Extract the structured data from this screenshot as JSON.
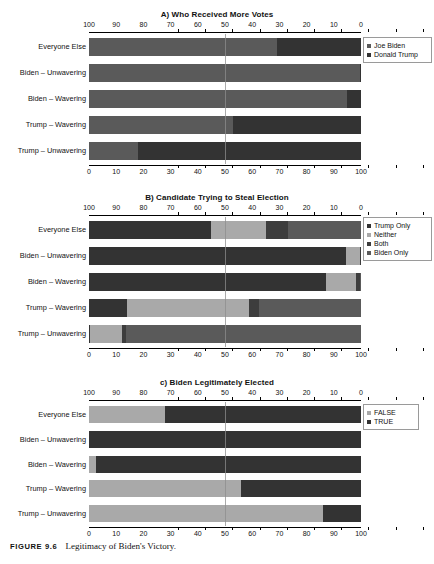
{
  "figure": {
    "caption_label": "FIGURE 9.6",
    "caption_text": "Legitimacy of Biden's Victory."
  },
  "categories": [
    "Everyone Else",
    "Biden – Unwavering",
    "Biden – Wavering",
    "Trump – Wavering",
    "Trump – Unwavering"
  ],
  "axis": {
    "top_ticks": [
      "100",
      "90",
      "80",
      "70",
      "60",
      "50",
      "40",
      "30",
      "20",
      "10",
      "0"
    ],
    "bottom_ticks": [
      "0",
      "10",
      "20",
      "30",
      "40",
      "50",
      "60",
      "70",
      "80",
      "90",
      "100"
    ],
    "min": 0,
    "max": 100,
    "reference_line": 50
  },
  "colors": {
    "dark": "#333333",
    "medium_dark": "#4e4e4e",
    "medium": "#5a5a5a",
    "light_gray": "#a9a9a9",
    "mid_gray": "#8e8e8e",
    "reference_line": "#8e8e8e",
    "text": "#111111"
  },
  "panels": [
    {
      "id": "panel-a",
      "title": "A) Who Received More Votes",
      "legend_labels": [
        "Joe Biden",
        "Donald Trump"
      ]
    },
    {
      "id": "panel-b",
      "title": "B) Candidate Trying to Steal Election",
      "legend_labels": [
        "Trump Only",
        "Neither",
        "Both",
        "Biden Only"
      ]
    },
    {
      "id": "panel-c",
      "title": "c) Biden Legitimately Elected",
      "legend_labels": [
        "FALSE",
        "TRUE"
      ]
    }
  ],
  "chart_data": [
    {
      "type": "bar",
      "orientation": "horizontal",
      "stacked": true,
      "percent": true,
      "title": "A) Who Received More Votes",
      "xlabel": "",
      "ylabel": "",
      "xlim": [
        0,
        100
      ],
      "top_axis_direction": "reversed",
      "grid": false,
      "reference_line": 50,
      "legend_position": "right",
      "categories": [
        "Everyone Else",
        "Biden – Unwavering",
        "Biden – Wavering",
        "Trump – Wavering",
        "Trump – Unwavering"
      ],
      "series": [
        {
          "name": "Joe Biden",
          "color": "#5a5a5a",
          "values": [
            69,
            99.5,
            95,
            53,
            18
          ]
        },
        {
          "name": "Donald Trump",
          "color": "#333333",
          "values": [
            31,
            0.5,
            5,
            47,
            82
          ]
        }
      ]
    },
    {
      "type": "bar",
      "orientation": "horizontal",
      "stacked": true,
      "percent": true,
      "title": "B) Candidate Trying to Steal Election",
      "xlabel": "",
      "ylabel": "",
      "xlim": [
        0,
        100
      ],
      "top_axis_direction": "reversed",
      "grid": false,
      "reference_line": 50,
      "legend_position": "right",
      "categories": [
        "Everyone Else",
        "Biden – Unwavering",
        "Biden – Wavering",
        "Trump – Wavering",
        "Trump – Unwavering"
      ],
      "series": [
        {
          "name": "Trump Only",
          "color": "#333333",
          "values": [
            45,
            94.5,
            87,
            14,
            0.5
          ]
        },
        {
          "name": "Neither",
          "color": "#a9a9a9",
          "values": [
            20,
            5,
            11,
            45,
            11.5
          ]
        },
        {
          "name": "Both",
          "color": "#3d3d3d",
          "values": [
            8,
            0.5,
            1.5,
            3.5,
            1.5
          ]
        },
        {
          "name": "Biden Only",
          "color": "#5a5a5a",
          "values": [
            27,
            0,
            0.5,
            37.5,
            86.5
          ]
        }
      ]
    },
    {
      "type": "bar",
      "orientation": "horizontal",
      "stacked": true,
      "percent": true,
      "title": "c) Biden Legitimately Elected",
      "xlabel": "",
      "ylabel": "",
      "xlim": [
        0,
        100
      ],
      "top_axis_direction": "reversed",
      "grid": false,
      "reference_line": 50,
      "legend_position": "right",
      "categories": [
        "Everyone Else",
        "Biden – Unwavering",
        "Biden – Wavering",
        "Trump – Wavering",
        "Trump – Unwavering"
      ],
      "series": [
        {
          "name": "FALSE",
          "color": "#a9a9a9",
          "values": [
            28,
            0,
            2.5,
            56,
            86
          ]
        },
        {
          "name": "TRUE",
          "color": "#333333",
          "values": [
            72,
            100,
            97.5,
            44,
            14
          ]
        }
      ]
    }
  ]
}
